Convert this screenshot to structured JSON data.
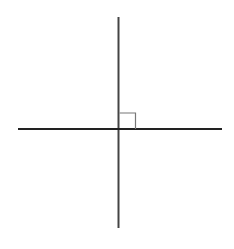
{
  "diagram": {
    "type": "geometry",
    "background": "#ffffff",
    "vertical_line": {
      "x1": 118.5,
      "y1": 17,
      "x2": 118.5,
      "y2": 228,
      "color": "#444444",
      "stroke_width": 2
    },
    "horizontal_line": {
      "x1": 18,
      "y1": 129,
      "x2": 222,
      "y2": 129,
      "color": "#222222",
      "stroke_width": 2
    },
    "right_angle_marker": {
      "x": 119.5,
      "y": 113,
      "size": 16,
      "color": "#777777",
      "stroke_width": 1.2
    },
    "intersection": {
      "x": 118.5,
      "y": 129
    },
    "angle_degrees": 90
  }
}
